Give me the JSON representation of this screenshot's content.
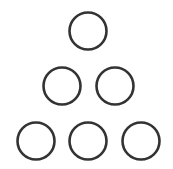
{
  "figure": {
    "stroke_color": "#333333",
    "background": "#ffffff",
    "stroke_width": 2.6,
    "radius": 18.5,
    "rows": [
      {
        "count": 1,
        "circles": [
          {
            "cx": 88,
            "cy": 31
          }
        ]
      },
      {
        "count": 2,
        "circles": [
          {
            "cx": 62,
            "cy": 86
          },
          {
            "cx": 115,
            "cy": 86
          }
        ]
      },
      {
        "count": 3,
        "circles": [
          {
            "cx": 36,
            "cy": 141
          },
          {
            "cx": 88,
            "cy": 141
          },
          {
            "cx": 141,
            "cy": 141
          }
        ]
      }
    ]
  }
}
